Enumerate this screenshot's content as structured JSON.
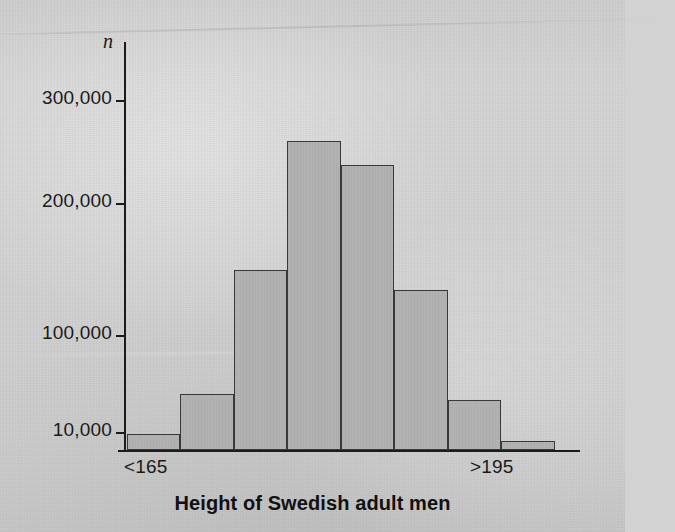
{
  "chart_data": {
    "type": "bar",
    "title": "Height of Swedish adult men",
    "xlabel": "",
    "ylabel": "n",
    "categories": [
      "<165",
      "165-170",
      "170-175",
      "175-180",
      "180-185",
      "185-190",
      "190-195",
      ">195"
    ],
    "values": [
      16000,
      50000,
      155000,
      265000,
      245000,
      138000,
      45000,
      10000
    ],
    "ylim": [
      0,
      330000
    ],
    "yticks": [
      10000,
      100000,
      200000,
      300000
    ],
    "ytick_labels": [
      "10,000",
      "100,000",
      "200,000",
      "300,000"
    ],
    "xtick_labels": [
      "<165",
      ">195"
    ],
    "grid": false,
    "legend": false,
    "bar_fill": "#b4b4b4",
    "bar_stroke": "#3a3a3a",
    "background": "#d2d2d2"
  },
  "axes": {
    "y_axis_label": "n",
    "y_ticks": [
      {
        "label": "300,000",
        "value": 300000
      },
      {
        "label": "200,000",
        "value": 200000
      },
      {
        "label": "100,000",
        "value": 100000
      },
      {
        "label": "10,000",
        "value": 10000
      }
    ],
    "x_ticks": [
      {
        "label": "<165"
      },
      {
        "label": ">195"
      }
    ]
  },
  "caption": {
    "title": "Height of Swedish adult men"
  }
}
